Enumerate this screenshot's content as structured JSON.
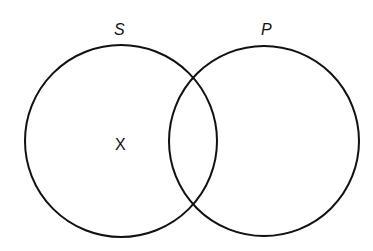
{
  "diagram": {
    "type": "venn",
    "sets": [
      {
        "id": "S",
        "label": "S",
        "cx": 121,
        "cy": 141,
        "r": 96
      },
      {
        "id": "P",
        "label": "P",
        "cx": 264,
        "cy": 141,
        "r": 95
      }
    ],
    "marks": [
      {
        "text": "X",
        "region": "S only"
      }
    ],
    "stroke_color": "#111111"
  }
}
